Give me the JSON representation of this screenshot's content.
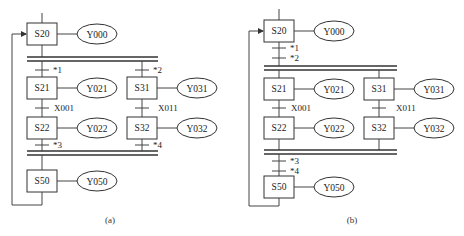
{
  "diagrams": [
    {
      "caption": "(a)",
      "steps": {
        "s20": "S20",
        "s21": "S21",
        "s31": "S31",
        "s22": "S22",
        "s32": "S32",
        "s50": "S50"
      },
      "outputs": {
        "y000": "Y000",
        "y021": "Y021",
        "y031": "Y031",
        "y022": "Y022",
        "y032": "Y032",
        "y050": "Y050"
      },
      "transitions": {
        "t1": "*1",
        "t2": "*2",
        "x001": "X001",
        "x011": "X011",
        "t3": "*3",
        "t4": "*4"
      }
    },
    {
      "caption": "(b)",
      "steps": {
        "s20": "S20",
        "s21": "S21",
        "s31": "S31",
        "s22": "S22",
        "s32": "S32",
        "s50": "S50"
      },
      "outputs": {
        "y000": "Y000",
        "y021": "Y021",
        "y031": "Y031",
        "y022": "Y022",
        "y032": "Y032",
        "y050": "Y050"
      },
      "transitions": {
        "t1": "*1",
        "t2": "*2",
        "x001": "X001",
        "x011": "X011",
        "t3": "*3",
        "t4": "*4"
      }
    }
  ]
}
